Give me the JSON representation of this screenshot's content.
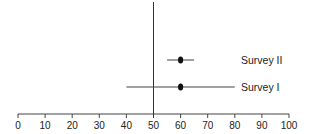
{
  "chart_data": {
    "type": "forest",
    "title": "",
    "xlabel": "",
    "ylabel": "",
    "xlim": [
      0,
      100
    ],
    "x_ticks": [
      0,
      10,
      20,
      30,
      40,
      50,
      60,
      70,
      80,
      90,
      100
    ],
    "x_tick_labels": [
      "0",
      "10",
      "20",
      "30",
      "40",
      "50",
      "60",
      "70",
      "80",
      "90",
      "100"
    ],
    "reference_line": 50,
    "grid": false,
    "legend": null,
    "series": [
      {
        "name": "Survey II",
        "estimate": 60,
        "lower": 55,
        "upper": 65
      },
      {
        "name": "Survey I",
        "estimate": 60,
        "lower": 40,
        "upper": 80
      }
    ]
  },
  "colors": {
    "line": "#333333",
    "point": "#111111",
    "text": "#222222"
  }
}
